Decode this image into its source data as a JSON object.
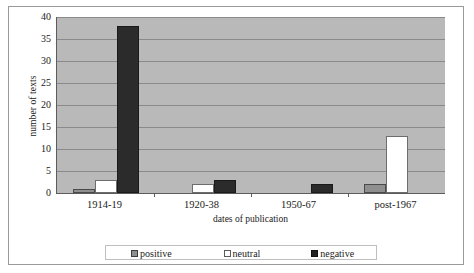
{
  "chart_data": {
    "type": "bar",
    "title": "",
    "xlabel": "dates of publication",
    "ylabel": "number of texts",
    "categories": [
      "1914-19",
      "1920-38",
      "1950-67",
      "post-1967"
    ],
    "series": [
      {
        "name": "positive",
        "color": "#8f8f8f",
        "values": [
          1,
          0,
          0,
          2
        ]
      },
      {
        "name": "neutral",
        "color": "#ffffff",
        "values": [
          3,
          2,
          0,
          13
        ]
      },
      {
        "name": "negative",
        "color": "#2b2b2b",
        "values": [
          38,
          3,
          2,
          0
        ]
      }
    ],
    "ylim": [
      0,
      40
    ],
    "yticks": [
      0,
      5,
      10,
      15,
      20,
      25,
      30,
      35,
      40
    ],
    "ytick_labels": [
      "0",
      "5",
      "10",
      "15",
      "20",
      "25",
      "30",
      "35",
      "40"
    ],
    "grid": true,
    "legend_position": "bottom",
    "plot_background": "#b9b9b9"
  }
}
